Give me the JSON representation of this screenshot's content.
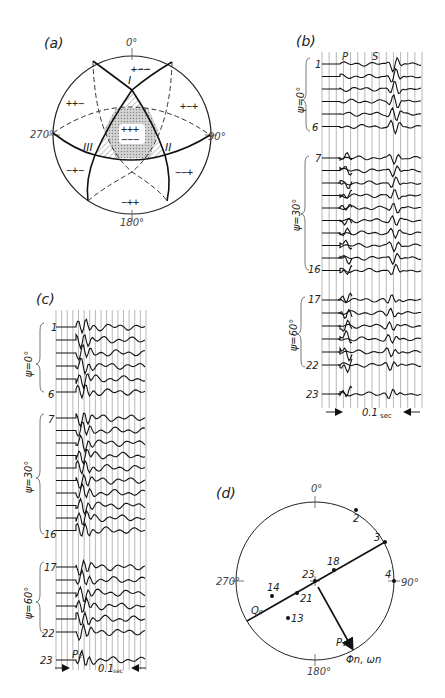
{
  "figure": {
    "panels": {
      "a": {
        "label": "(a)",
        "azimuths": {
          "top": "0°",
          "right": "90°",
          "bottom": "180°",
          "left": "270°"
        },
        "nodal_labels": [
          "I",
          "II",
          "III"
        ],
        "quadrant_signs": {
          "top": "+−−",
          "upper_left": "++−",
          "upper_right": "+−+",
          "center_top": "+++",
          "center_bottom": "−−−",
          "lower_left": "−+−",
          "lower_right": "−−+",
          "bottom": "−++"
        }
      },
      "b": {
        "label": "(b)",
        "phase_labels": [
          "P",
          "S"
        ],
        "groups": [
          {
            "psi": "ψ=0°",
            "first": "1",
            "last": "6"
          },
          {
            "psi": "ψ=30°",
            "first": "7",
            "last": "16"
          },
          {
            "psi": "ψ=60°",
            "first": "17",
            "last": "22"
          }
        ],
        "extra_trace": "23",
        "scale": {
          "value": "0.1",
          "unit": "sec"
        }
      },
      "c": {
        "label": "(c)",
        "groups": [
          {
            "psi": "ψ=0°",
            "first": "1",
            "last": "6"
          },
          {
            "psi": "ψ=30°",
            "first": "7",
            "last": "16"
          },
          {
            "psi": "ψ=60°",
            "first": "17",
            "last": "22"
          }
        ],
        "extra_trace": "23",
        "phase_label": "P₂",
        "scale": {
          "value": "0.1",
          "unit": "sec"
        }
      },
      "d": {
        "label": "(d)",
        "azimuths": {
          "top": "0°",
          "right": "90°",
          "bottom": "180°",
          "left": "270°"
        },
        "points": [
          "2",
          "3",
          "4",
          "18",
          "23",
          "21",
          "14",
          "13"
        ],
        "line_labels": {
          "q": "Q₀",
          "p": "P₁",
          "arrow": "Φn, ωn"
        }
      }
    },
    "caption": ""
  }
}
